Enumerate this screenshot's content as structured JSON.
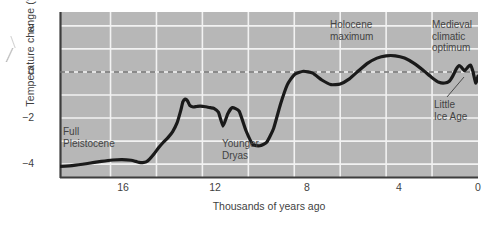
{
  "chart_data": {
    "type": "line",
    "title": "",
    "xlabel": "Thousands of years ago",
    "ylabel": "Temperature change (°C)",
    "xlim": [
      18.2,
      0
    ],
    "ylim": [
      -4.6,
      2.6
    ],
    "x_reversed": true,
    "grid": true,
    "legend": "none",
    "x_ticks": [
      16,
      12,
      8,
      4,
      0
    ],
    "x_tick_labels": [
      "16",
      "12",
      "8",
      "4",
      "0"
    ],
    "x_gridlines": [
      16,
      14,
      12,
      10,
      8,
      6,
      4,
      2
    ],
    "y_ticks": [
      2,
      0,
      -2,
      -4
    ],
    "y_tick_labels": [
      "2",
      "0",
      "−2",
      "−4"
    ],
    "y_gridlines": [
      2,
      1,
      0,
      -1,
      -2,
      -3,
      -4
    ],
    "zero_reference_line": 0,
    "zero_line_style": "dashed",
    "series": [
      {
        "name": "Temperature change",
        "color": "#1a1a1a",
        "x": [
          18.2,
          17.6,
          17.0,
          16.4,
          15.9,
          15.5,
          15.1,
          14.9,
          14.75,
          14.6,
          14.45,
          14.3,
          14.1,
          13.9,
          13.7,
          13.5,
          13.3,
          13.1,
          12.95,
          12.85,
          12.75,
          12.65,
          12.55,
          12.4,
          12.25,
          12.1,
          11.95,
          11.8,
          11.65,
          11.5,
          11.3,
          11.1,
          10.9,
          10.7,
          10.4,
          10.1,
          9.8,
          9.5,
          9.2,
          8.9,
          8.6,
          8.3,
          8.0,
          7.6,
          7.2,
          6.8,
          6.4,
          6.0,
          5.6,
          5.2,
          4.8,
          4.4,
          4.0,
          3.6,
          3.2,
          2.8,
          2.4,
          2.0,
          1.7,
          1.45,
          1.25,
          1.1,
          0.95,
          0.82,
          0.7,
          0.58,
          0.45,
          0.33,
          0.22,
          0.1,
          0.0
        ],
        "y": [
          -4.1,
          -4.05,
          -3.97,
          -3.88,
          -3.82,
          -3.8,
          -3.83,
          -3.88,
          -3.92,
          -3.93,
          -3.9,
          -3.78,
          -3.55,
          -3.28,
          -3.05,
          -2.85,
          -2.6,
          -2.2,
          -1.7,
          -1.3,
          -1.18,
          -1.25,
          -1.45,
          -1.52,
          -1.5,
          -1.48,
          -1.5,
          -1.52,
          -1.55,
          -1.58,
          -1.75,
          -2.35,
          -1.82,
          -1.55,
          -1.7,
          -2.55,
          -3.15,
          -3.2,
          -3.05,
          -2.45,
          -1.4,
          -0.55,
          -0.12,
          0.03,
          -0.05,
          -0.35,
          -0.55,
          -0.52,
          -0.3,
          0.05,
          0.38,
          0.6,
          0.7,
          0.7,
          0.6,
          0.38,
          0.08,
          -0.25,
          -0.45,
          -0.48,
          -0.4,
          -0.18,
          0.12,
          0.28,
          0.18,
          0.05,
          0.2,
          0.3,
          0.02,
          -0.48,
          -0.18
        ],
        "style": "solid",
        "linewidth": 3.2
      }
    ],
    "annotations": [
      {
        "id": "full-pleistocene",
        "text": "Full\nPleistocene",
        "x_px": 63,
        "y_px": 126,
        "align": "left"
      },
      {
        "id": "younger-dryas",
        "text": "Younger\nDryas",
        "x_px": 222,
        "y_px": 138,
        "align": "left"
      },
      {
        "id": "holocene-maximum",
        "text": "Holocene\nmaximum",
        "x_px": 330,
        "y_px": 19,
        "align": "left"
      },
      {
        "id": "medieval-optimum",
        "text": "Medieval\nclimatic\noptimum",
        "x_px": 432,
        "y_px": 19,
        "align": "left"
      },
      {
        "id": "little-ice-age",
        "text": "Little\nIce Age",
        "x_px": 434,
        "y_px": 99,
        "align": "left"
      }
    ],
    "leader_lines": [
      {
        "id": "little-ice-age-leader",
        "from_px": [
          447,
          97
        ],
        "to_px": [
          464,
          77
        ]
      }
    ]
  },
  "style": {
    "plot_background": "#b7b7b7",
    "page_background": "#ffffff",
    "gridline_color": "#f2f2f2",
    "curve_color": "#1a1a1a",
    "axis_color": "#3d3d3d",
    "text_color": "#3f3f3f",
    "zero_line_color": "#6d6d6d"
  }
}
